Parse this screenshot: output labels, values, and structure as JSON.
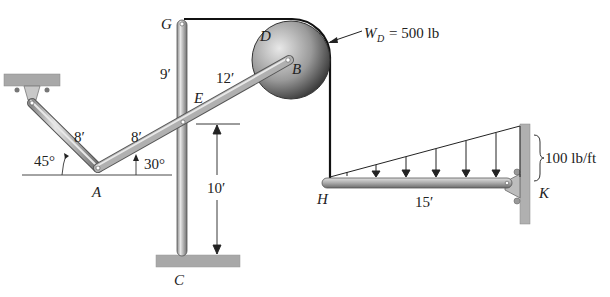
{
  "diagram": {
    "type": "statics-frame-problem",
    "points": {
      "A": "A",
      "B": "B",
      "C": "C",
      "D": "D",
      "E": "E",
      "G": "G",
      "H": "H",
      "K": "K"
    },
    "dimensions": {
      "upper_left_link": "8′",
      "lower_right_link_AE": "8′",
      "EB_segment": "12′",
      "GE_segment": "9′",
      "E_to_C": "10′",
      "HK_beam": "15′"
    },
    "angles": {
      "left_link": "45°",
      "right_link": "30°"
    },
    "loads": {
      "pulley_weight_symbol": "W",
      "pulley_weight_subscript": "D",
      "pulley_weight_value": "= 500 lb",
      "distributed_load_max": "100 lb/ft"
    },
    "colors": {
      "member_fill": "#b8b8b8",
      "member_edge": "#555555",
      "ground_fill": "#a8a8a8",
      "cable": "#111111",
      "text": "#222222"
    }
  }
}
